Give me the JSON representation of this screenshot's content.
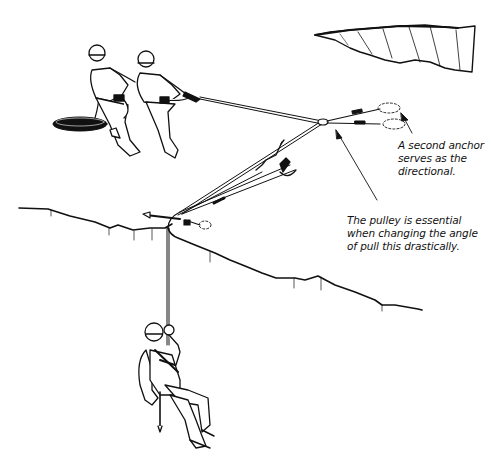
{
  "figure": {
    "colors": {
      "ink": "#111111",
      "background": "#ffffff",
      "rope": "#444444"
    },
    "annotations": [
      {
        "id": "anchor",
        "text": "A second anchor\nserves as the\ndirectional."
      },
      {
        "id": "pulley",
        "text": "The pulley is essential\nwhen changing the angle\nof pull this drastically."
      }
    ],
    "elements": [
      {
        "name": "hauler-left",
        "description": "climber with helmet pulling rope"
      },
      {
        "name": "hauler-right",
        "description": "climber with helmet pulling rope"
      },
      {
        "name": "rope-coil",
        "description": "coiled rope on snow"
      },
      {
        "name": "directional-pulley",
        "description": "pulley redirecting the haul line"
      },
      {
        "name": "second-anchor",
        "description": "snow anchors for directional"
      },
      {
        "name": "edge-anchor",
        "description": "anchor near crevasse lip"
      },
      {
        "name": "crevasse-lip",
        "description": "edge of crevasse"
      },
      {
        "name": "far-crevasse",
        "description": "distant crevasse wall"
      },
      {
        "name": "fallen-climber",
        "description": "climber hanging on rope in crevasse"
      }
    ]
  }
}
